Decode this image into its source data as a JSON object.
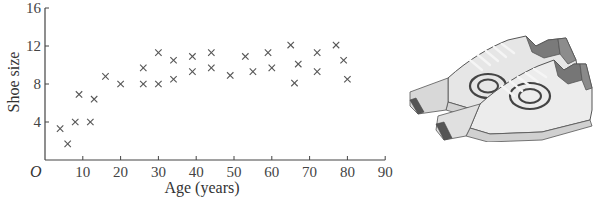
{
  "chart_data": {
    "type": "scatter",
    "title": "",
    "xlabel": "Age (years)",
    "ylabel": "Shoe size",
    "origin_label": "O",
    "xlim": [
      0,
      90
    ],
    "ylim": [
      0,
      16
    ],
    "x_ticks": [
      10,
      20,
      30,
      40,
      50,
      60,
      70,
      80,
      90
    ],
    "x_tick_labels": [
      "10",
      "20",
      "30",
      "40",
      "50",
      "60",
      "70",
      "80",
      "90"
    ],
    "y_ticks": [
      4,
      8,
      12,
      16
    ],
    "y_tick_labels": [
      "4",
      "8",
      "12",
      "16"
    ],
    "grid": false,
    "legend": null,
    "marker": "x",
    "marker_color": "#555555",
    "axis_color": "#444444",
    "series": [
      {
        "name": "Shoe size vs age",
        "points": [
          {
            "x": 4,
            "y": 3.3
          },
          {
            "x": 6,
            "y": 1.7
          },
          {
            "x": 8,
            "y": 4.0
          },
          {
            "x": 9,
            "y": 6.9
          },
          {
            "x": 12,
            "y": 4.0
          },
          {
            "x": 13,
            "y": 6.4
          },
          {
            "x": 16,
            "y": 8.8
          },
          {
            "x": 20,
            "y": 8.0
          },
          {
            "x": 26,
            "y": 9.7
          },
          {
            "x": 26,
            "y": 8.0
          },
          {
            "x": 30,
            "y": 11.3
          },
          {
            "x": 30,
            "y": 8.0
          },
          {
            "x": 34,
            "y": 10.5
          },
          {
            "x": 34,
            "y": 8.5
          },
          {
            "x": 39,
            "y": 10.9
          },
          {
            "x": 39,
            "y": 9.3
          },
          {
            "x": 44,
            "y": 11.3
          },
          {
            "x": 44,
            "y": 9.7
          },
          {
            "x": 49,
            "y": 8.9
          },
          {
            "x": 53,
            "y": 10.9
          },
          {
            "x": 55,
            "y": 9.3
          },
          {
            "x": 59,
            "y": 11.3
          },
          {
            "x": 60,
            "y": 9.7
          },
          {
            "x": 65,
            "y": 12.1
          },
          {
            "x": 67,
            "y": 10.1
          },
          {
            "x": 66,
            "y": 8.1
          },
          {
            "x": 72,
            "y": 11.3
          },
          {
            "x": 72,
            "y": 9.3
          },
          {
            "x": 77,
            "y": 12.1
          },
          {
            "x": 79,
            "y": 10.5
          },
          {
            "x": 80,
            "y": 8.5
          }
        ]
      }
    ]
  },
  "illustration": {
    "subject": "pair-of-sneakers",
    "tone": "grayscale"
  }
}
